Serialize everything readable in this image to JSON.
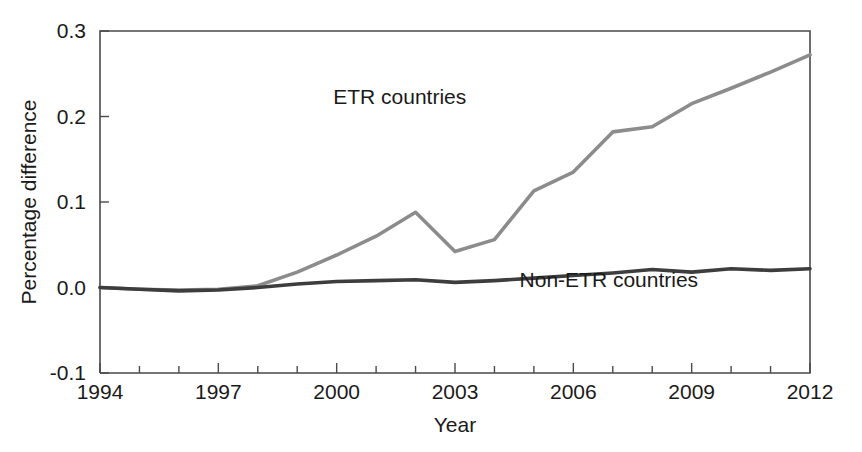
{
  "chart_data": {
    "type": "line",
    "title": "",
    "subtitle": "",
    "xlabel": "Year",
    "ylabel": "Percentage difference",
    "xlim": [
      1994,
      2012
    ],
    "ylim": [
      -0.1,
      0.3
    ],
    "grid": false,
    "legend_position": "inline-annotation",
    "x_ticks": [
      "1994",
      "1997",
      "2000",
      "2003",
      "2006",
      "2009",
      "2012"
    ],
    "x_tick_values": [
      1994,
      1997,
      2000,
      2003,
      2006,
      2009,
      2012
    ],
    "x_minor_ticks": [
      1995,
      1996,
      1998,
      1999,
      2001,
      2002,
      2004,
      2005,
      2007,
      2008,
      2010,
      2011
    ],
    "y_ticks": [
      "0.3",
      "0.2",
      "0.1",
      "0.0",
      "-0.1"
    ],
    "y_tick_values": [
      0.3,
      0.2,
      0.1,
      0.0,
      -0.1
    ],
    "x": [
      1994,
      1995,
      1996,
      1997,
      1998,
      1999,
      2000,
      2001,
      2002,
      2003,
      2004,
      2005,
      2006,
      2007,
      2008,
      2009,
      2010,
      2011,
      2012
    ],
    "series": [
      {
        "name": "ETR countries",
        "color": "#8c8c8c",
        "stroke_width": 3.6,
        "label_x": 2001.6,
        "label_y": 0.215,
        "values": [
          0.0,
          -0.002,
          -0.003,
          -0.002,
          0.002,
          0.018,
          0.038,
          0.06,
          0.088,
          0.042,
          0.056,
          0.113,
          0.135,
          0.182,
          0.188,
          0.215,
          0.233,
          0.252,
          0.272
        ]
      },
      {
        "name": "Non-ETR countries",
        "color": "#3d3d3d",
        "stroke_width": 3.6,
        "label_x": 2006.9,
        "label_y": 0.001,
        "values": [
          0.0,
          -0.002,
          -0.004,
          -0.003,
          0.0,
          0.004,
          0.007,
          0.008,
          0.009,
          0.006,
          0.008,
          0.011,
          0.014,
          0.017,
          0.021,
          0.018,
          0.022,
          0.02,
          0.022
        ]
      }
    ]
  },
  "axes": {
    "y_axis_title": "Percentage difference",
    "x_axis_title": "Year"
  },
  "annotations": {
    "etr_label": "ETR countries",
    "non_etr_label": "Non-ETR countries"
  }
}
